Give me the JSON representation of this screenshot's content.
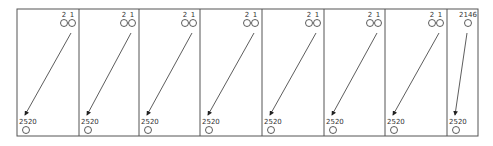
{
  "diagram": {
    "frame": {
      "x": 17,
      "y": 9,
      "width": 461,
      "height": 127,
      "stroke": "#555555"
    },
    "panels": [
      {
        "x0": 17,
        "x1": 79,
        "top_nodes": [
          "2",
          "1"
        ],
        "bottom_node": "2520"
      },
      {
        "x0": 79,
        "x1": 139,
        "top_nodes": [
          "2",
          "1"
        ],
        "bottom_node": "2520"
      },
      {
        "x0": 139,
        "x1": 200,
        "top_nodes": [
          "2",
          "1"
        ],
        "bottom_node": "2520"
      },
      {
        "x0": 200,
        "x1": 262,
        "top_nodes": [
          "2",
          "1"
        ],
        "bottom_node": "2520"
      },
      {
        "x0": 262,
        "x1": 324,
        "top_nodes": [
          "2",
          "1"
        ],
        "bottom_node": "2520"
      },
      {
        "x0": 324,
        "x1": 385,
        "top_nodes": [
          "2",
          "1"
        ],
        "bottom_node": "2520"
      },
      {
        "x0": 385,
        "x1": 447,
        "top_nodes": [
          "2",
          "1"
        ],
        "bottom_node": "2520"
      },
      {
        "x0": 447,
        "x1": 478,
        "top_nodes": [
          "2146"
        ],
        "bottom_node": "2520"
      }
    ]
  }
}
